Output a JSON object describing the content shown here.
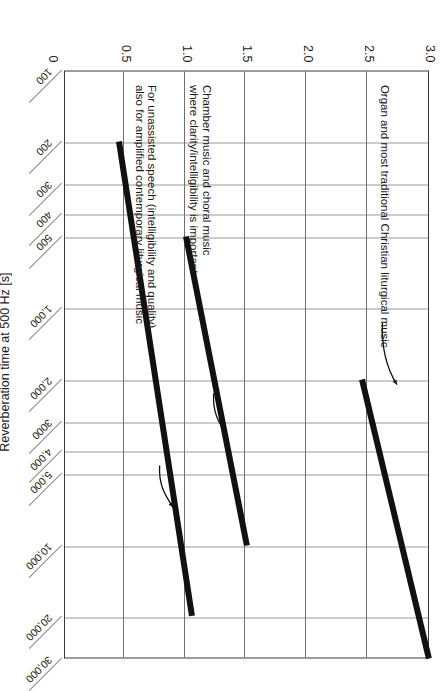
{
  "chart_data": {
    "type": "line",
    "title": "",
    "xlabel": "",
    "ylabel": "Reverberation time at 500 Hz [s]",
    "xscale": "log",
    "xlim": [
      100,
      30000
    ],
    "ylim": [
      0,
      3.0
    ],
    "grid": true,
    "legend_position": "none",
    "xticks": [
      "100",
      "200",
      "300",
      "400",
      "500",
      "1,000",
      "2,000",
      "3000",
      "4,000",
      "5,000",
      "10,000",
      "20,000",
      "30,000"
    ],
    "xtick_values": [
      100,
      200,
      300,
      400,
      500,
      1000,
      2000,
      3000,
      4000,
      5000,
      10000,
      20000,
      30000
    ],
    "yticks": [
      "0",
      "0.5",
      "1.0",
      "1.5",
      "2.0",
      "2.5",
      "3.0"
    ],
    "ytick_values": [
      0,
      0.5,
      1.0,
      1.5,
      2.0,
      2.5,
      3.0
    ],
    "series": [
      {
        "name": "Organ and most traditional Christian liturgical music",
        "x": [
          2000,
          30000
        ],
        "y": [
          2.45,
          3.0
        ],
        "linewidth": "thick"
      },
      {
        "name": "Chamber music and choral music where clarity/intelligibility is important",
        "x": [
          500,
          10000
        ],
        "y": [
          1.0,
          1.5
        ],
        "linewidth": "thick"
      },
      {
        "name": "For unassisted speech (intelligibility and quality) also for amplified contemporary liturgical music",
        "x": [
          200,
          20000
        ],
        "y": [
          0.45,
          1.05
        ],
        "linewidth": "thick"
      }
    ],
    "annotations": [
      {
        "id": "organ",
        "text": "Organ and most traditional Christian liturgical music",
        "points_to_series": 0
      },
      {
        "id": "chamber",
        "line1": "Chamber music and choral music",
        "line2": "where clarity/intelligibility is important",
        "points_to_series": 1
      },
      {
        "id": "speech",
        "line1": "For unassisted speech (intelligibility and quality)",
        "line2": "also for amplified contemporary liturgical music",
        "points_to_series": 2
      }
    ]
  },
  "colors": {
    "line": "#111111",
    "frame": "#3a3a3a",
    "grid": "#8a8a8a",
    "background": "#ffffff",
    "text": "#1a1a1a"
  }
}
